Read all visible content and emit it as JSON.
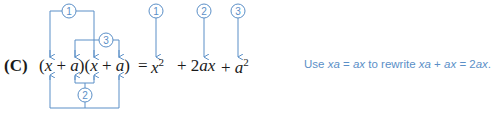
{
  "figure": {
    "label": "(C)",
    "lhs": {
      "open1": "(",
      "x1": "x",
      "plus1": " + ",
      "a1": "a",
      "close1": ")",
      "open2": "(",
      "x2": "x",
      "plus2": " + ",
      "a2": "a",
      "close2": ")"
    },
    "equals": "=",
    "rhs": {
      "term1_base": "x",
      "term1_exp": "2",
      "plus1": "+ 2",
      "term2": "ax",
      "plus2": "+",
      "term3_base": "a",
      "term3_exp": "2"
    },
    "markers": [
      "1",
      "2",
      "3"
    ],
    "note": {
      "prefix": "Use ",
      "xa1": "xa",
      "eq1": " = ",
      "ax1": "ax",
      "mid": " to rewrite ",
      "xa2": "xa",
      "plus": " + ",
      "ax2": "ax",
      "eq2": " = 2",
      "ax3": "ax",
      "end": "."
    },
    "accent_color": "#5b8fc7"
  }
}
